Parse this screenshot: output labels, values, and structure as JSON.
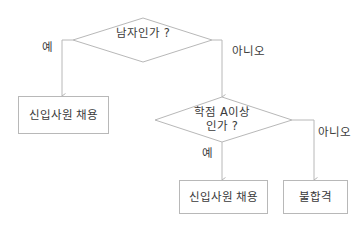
{
  "diagram": {
    "type": "flowchart",
    "stroke_color": "#b8b8b8",
    "text_color": "#3a3a3a",
    "decisions": [
      {
        "id": "d1",
        "lines": [
          "남자인가 ?"
        ]
      },
      {
        "id": "d2",
        "lines": [
          "학점 A이상",
          "인가 ?"
        ]
      }
    ],
    "processes": [
      {
        "id": "p1",
        "label": "신입사원 채용"
      },
      {
        "id": "p2",
        "label": "신입사원 채용"
      },
      {
        "id": "p3",
        "label": "불합격"
      }
    ],
    "edges": [
      {
        "from": "d1",
        "to": "p1",
        "label": "예"
      },
      {
        "from": "d1",
        "to": "d2",
        "label": "아니오"
      },
      {
        "from": "d2",
        "to": "p2",
        "label": "예"
      },
      {
        "from": "d2",
        "to": "p3",
        "label": "아니오"
      }
    ]
  }
}
